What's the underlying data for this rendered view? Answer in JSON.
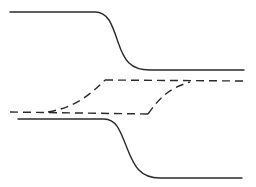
{
  "figure": {
    "labels": [],
    "curves": [
      {
        "id": "upper-solid-step",
        "style": "solid",
        "shape": "sigmoid step down",
        "level_before": "high",
        "level_after": "middle-upper"
      },
      {
        "id": "dashed-loop",
        "style": "dashed",
        "shape": "hysteresis loop",
        "branches": [
          "bottom-flat",
          "left-rising",
          "top-flat",
          "right-rising"
        ]
      },
      {
        "id": "lower-solid-step",
        "style": "solid",
        "shape": "sigmoid step down",
        "level_before": "middle-lower",
        "level_after": "low"
      }
    ]
  },
  "colors": {
    "line": "#2a2a2a",
    "background": "#ffffff"
  }
}
